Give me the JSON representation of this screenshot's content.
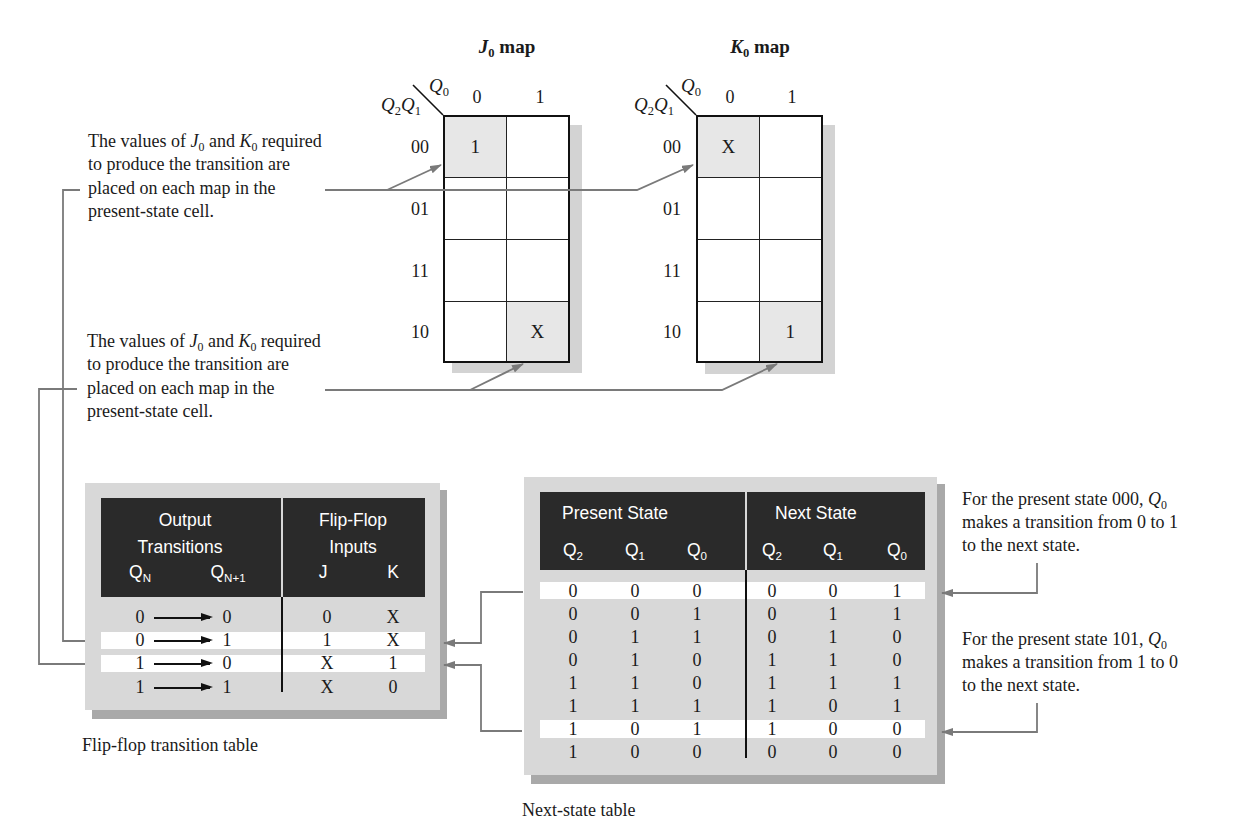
{
  "kmaps": {
    "j0": {
      "title": {
        "var": "J",
        "sub": "0",
        "suffix": " map"
      },
      "col_var": {
        "var": "Q",
        "sub": "0"
      },
      "row_vars": [
        {
          "var": "Q",
          "sub": "2"
        },
        {
          "var": "Q",
          "sub": "1"
        }
      ],
      "col_labels": [
        "0",
        "1"
      ],
      "row_labels": [
        "00",
        "01",
        "11",
        "10"
      ],
      "cells": [
        [
          "1",
          ""
        ],
        [
          "",
          ""
        ],
        [
          "",
          ""
        ],
        [
          "",
          "X"
        ]
      ],
      "shaded_cells": [
        [
          0,
          0
        ],
        [
          3,
          1
        ]
      ]
    },
    "k0": {
      "title": {
        "var": "K",
        "sub": "0",
        "suffix": " map"
      },
      "col_var": {
        "var": "Q",
        "sub": "0"
      },
      "row_vars": [
        {
          "var": "Q",
          "sub": "2"
        },
        {
          "var": "Q",
          "sub": "1"
        }
      ],
      "col_labels": [
        "0",
        "1"
      ],
      "row_labels": [
        "00",
        "01",
        "11",
        "10"
      ],
      "cells": [
        [
          "X",
          ""
        ],
        [
          "",
          ""
        ],
        [
          "",
          ""
        ],
        [
          "",
          "1"
        ]
      ],
      "shaded_cells": [
        [
          0,
          0
        ],
        [
          3,
          1
        ]
      ]
    }
  },
  "annotations": {
    "top_left": {
      "prefix": "The values of ",
      "var1": "J",
      "var1_sub": "0",
      "mid": " and ",
      "var2": "K",
      "var2_sub": "0",
      "suffix": " required",
      "lines": [
        "to produce the transition are",
        "placed on each map in the",
        "present-state cell."
      ]
    },
    "bottom_left": {
      "prefix": "The values of ",
      "var1": "J",
      "var1_sub": "0",
      "mid": " and ",
      "var2": "K",
      "var2_sub": "0",
      "suffix": " required",
      "lines": [
        "to produce the transition are",
        "placed on each map in the",
        "present-state cell."
      ]
    },
    "right_top": {
      "prefix": "For the present state 000, ",
      "var": "Q",
      "sub": "0",
      "lines": [
        "makes a transition from 0 to 1",
        "to the next state."
      ]
    },
    "right_bottom": {
      "prefix": "For the present state 101, ",
      "var": "Q",
      "sub": "0",
      "lines": [
        "makes a transition from 1 to 0",
        "to the next state."
      ]
    }
  },
  "flipflop_table": {
    "caption": "Flip-flop transition table",
    "header": {
      "group1_line1": "Output",
      "group1_line2": "Transitions",
      "qn": {
        "var": "Q",
        "sub": "N"
      },
      "qn1": {
        "var": "Q",
        "sub": "N+1"
      },
      "group2_line1": "Flip-Flop",
      "group2_line2": "Inputs",
      "j": "J",
      "k": "K"
    },
    "rows": [
      {
        "qn": "0",
        "qn1": "0",
        "j": "0",
        "k": "X"
      },
      {
        "qn": "0",
        "qn1": "1",
        "j": "1",
        "k": "X"
      },
      {
        "qn": "1",
        "qn1": "0",
        "j": "X",
        "k": "1"
      },
      {
        "qn": "1",
        "qn1": "1",
        "j": "X",
        "k": "0"
      }
    ],
    "highlighted_rows": [
      1,
      2
    ]
  },
  "next_state_table": {
    "caption": "Next-state table",
    "header": {
      "present": "Present State",
      "next": "Next State",
      "columns": [
        {
          "var": "Q",
          "sub": "2"
        },
        {
          "var": "Q",
          "sub": "1"
        },
        {
          "var": "Q",
          "sub": "0"
        },
        {
          "var": "Q",
          "sub": "2"
        },
        {
          "var": "Q",
          "sub": "1"
        },
        {
          "var": "Q",
          "sub": "0"
        }
      ]
    },
    "rows": [
      [
        "0",
        "0",
        "0",
        "0",
        "0",
        "1"
      ],
      [
        "0",
        "0",
        "1",
        "0",
        "1",
        "1"
      ],
      [
        "0",
        "1",
        "1",
        "0",
        "1",
        "0"
      ],
      [
        "0",
        "1",
        "0",
        "1",
        "1",
        "0"
      ],
      [
        "1",
        "1",
        "0",
        "1",
        "1",
        "1"
      ],
      [
        "1",
        "1",
        "1",
        "1",
        "0",
        "1"
      ],
      [
        "1",
        "0",
        "1",
        "1",
        "0",
        "0"
      ],
      [
        "1",
        "0",
        "0",
        "0",
        "0",
        "0"
      ]
    ],
    "highlighted_rows": [
      0,
      6
    ]
  },
  "colors": {
    "header_bg": "#2a2a2a",
    "panel_bg": "#d8d8d8",
    "panel_shadow": "#a9a9a9",
    "highlight_row": "#ffffff",
    "connector": "#7a7a7a",
    "kmap_cell_shade": "#e7e7e7",
    "kmap_shadow": "#d3d3d3"
  }
}
